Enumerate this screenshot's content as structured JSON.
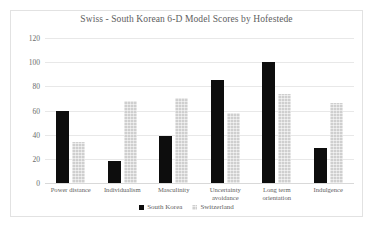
{
  "chart_data": {
    "type": "bar",
    "title": "Swiss - South Korean 6-D Model Scores by Hofestede",
    "xlabel": "",
    "ylabel": "",
    "ylim": [
      0,
      120
    ],
    "yticks": [
      0,
      20,
      40,
      60,
      80,
      100,
      120
    ],
    "grid": true,
    "legend_position": "bottom",
    "categories": [
      "Power distance",
      "Individualism",
      "Masculinity",
      "Uncertainty avoidance",
      "Long term orientation",
      "Indulgence"
    ],
    "series": [
      {
        "name": "South Korea",
        "color": "#0d0d0d",
        "values": [
          60,
          18,
          39,
          85,
          100,
          29
        ]
      },
      {
        "name": "Switzerland",
        "color": "#cfcfcf",
        "values": [
          34,
          68,
          70,
          58,
          74,
          66
        ]
      }
    ]
  }
}
